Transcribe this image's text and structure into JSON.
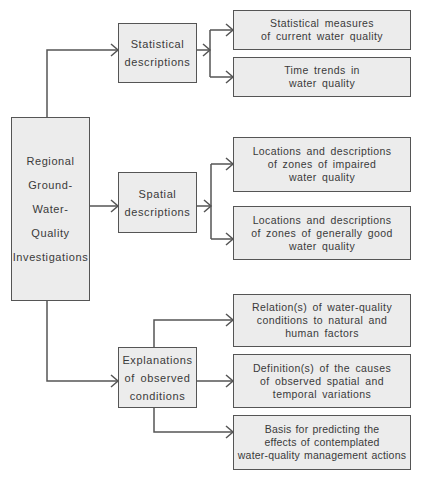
{
  "diagram": {
    "root": {
      "lines": [
        "Regional",
        "Ground-",
        "Water-",
        "Quality",
        "Investigations"
      ]
    },
    "categories": [
      {
        "lines": [
          "Statistical",
          "descriptions"
        ],
        "outcomes": [
          {
            "lines": [
              "Statistical  measures",
              "of current water quality"
            ]
          },
          {
            "lines": [
              "Time trends in",
              "water  quality"
            ]
          }
        ]
      },
      {
        "lines": [
          "Spatial",
          "descriptions"
        ],
        "outcomes": [
          {
            "lines": [
              "Locations and descriptions",
              "of zones of impaired",
              "water  quality"
            ]
          },
          {
            "lines": [
              "Locations and descriptions",
              "of zones of generally good",
              "water  quality"
            ]
          }
        ]
      },
      {
        "lines": [
          "Explanations",
          "of observed",
          "conditions"
        ],
        "outcomes": [
          {
            "lines": [
              "Relation(s)  of  water-quality",
              "conditions  to natural and",
              "human  factors"
            ]
          },
          {
            "lines": [
              "Definition(s) of  the causes",
              "of observed spatial and",
              "temporal   variations"
            ]
          },
          {
            "lines": [
              "Basis for predicting the",
              "effects of contemplated",
              "water-quality  management  actions"
            ]
          }
        ]
      }
    ],
    "colors": {
      "box_fill": "#ececec",
      "line": "#555555",
      "text": "#3a3a3a"
    }
  }
}
